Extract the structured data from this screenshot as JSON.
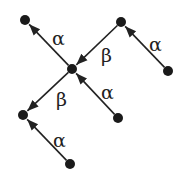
{
  "diagram": {
    "type": "directed-tree",
    "colors": {
      "node": "#1a1a1a",
      "edge": "#222222",
      "label": "#222222",
      "background": "#ffffff"
    },
    "nodes": [
      {
        "id": "n_topleft",
        "x": 25,
        "y": 20
      },
      {
        "id": "n_topright",
        "x": 121,
        "y": 22
      },
      {
        "id": "n_center",
        "x": 72,
        "y": 69
      },
      {
        "id": "n_right",
        "x": 168,
        "y": 71
      },
      {
        "id": "n_left",
        "x": 23,
        "y": 115
      },
      {
        "id": "n_bottomright",
        "x": 118,
        "y": 118
      },
      {
        "id": "n_bottom",
        "x": 70,
        "y": 164
      }
    ],
    "edges": [
      {
        "from": "n_center",
        "to": "n_topleft",
        "label": "α",
        "label_x": 52,
        "label_y": 45
      },
      {
        "from": "n_topright",
        "to": "n_center",
        "label": "β",
        "label_x": 101,
        "label_y": 62
      },
      {
        "from": "n_right",
        "to": "n_topright",
        "label": "α",
        "label_x": 149,
        "label_y": 51
      },
      {
        "from": "n_bottomright",
        "to": "n_center",
        "label": "α",
        "label_x": 101,
        "label_y": 99
      },
      {
        "from": "n_center",
        "to": "n_left",
        "label": "β",
        "label_x": 56,
        "label_y": 106
      },
      {
        "from": "n_bottom",
        "to": "n_left",
        "label": "α",
        "label_x": 53,
        "label_y": 147
      }
    ]
  }
}
